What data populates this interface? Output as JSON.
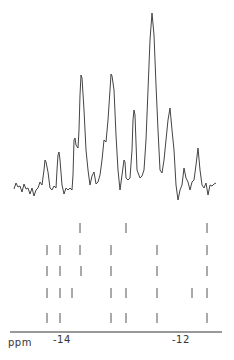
{
  "chart_data": {
    "type": "line",
    "title": "",
    "xlabel": "ppm",
    "ylabel": "",
    "x_axis": {
      "direction": "decreasing-left-to-right-magnitude",
      "ticks": [
        {
          "label": "-14",
          "px": 59
        },
        {
          "label": "-12",
          "px": 180
        }
      ],
      "range_ppm": [
        -14.2,
        -11.6
      ],
      "axis_line": {
        "x1": 10,
        "x2": 222,
        "y": 332
      }
    },
    "grid": false,
    "legend": null,
    "spectrum": {
      "description": "NMR spectrum trace with multiple resonances; tallest peak near -12.5 ppm",
      "points": [
        [
          14,
          189
        ],
        [
          16,
          183
        ],
        [
          18,
          187
        ],
        [
          20,
          186
        ],
        [
          22,
          192
        ],
        [
          24,
          184
        ],
        [
          26,
          189
        ],
        [
          28,
          188
        ],
        [
          30,
          194
        ],
        [
          32,
          188
        ],
        [
          34,
          196
        ],
        [
          36,
          190
        ],
        [
          38,
          188
        ],
        [
          40,
          182
        ],
        [
          42,
          185
        ],
        [
          44,
          170
        ],
        [
          45,
          160
        ],
        [
          46,
          162
        ],
        [
          48,
          172
        ],
        [
          50,
          188
        ],
        [
          52,
          190
        ],
        [
          54,
          186
        ],
        [
          56,
          188
        ],
        [
          57,
          170
        ],
        [
          58,
          155
        ],
        [
          59,
          152
        ],
        [
          60,
          160
        ],
        [
          62,
          185
        ],
        [
          64,
          194
        ],
        [
          66,
          188
        ],
        [
          68,
          190
        ],
        [
          70,
          188
        ],
        [
          72,
          190
        ],
        [
          73,
          175
        ],
        [
          74,
          140
        ],
        [
          75,
          138
        ],
        [
          76,
          145
        ],
        [
          78,
          148
        ],
        [
          79,
          130
        ],
        [
          80,
          95
        ],
        [
          81,
          75
        ],
        [
          82,
          78
        ],
        [
          84,
          110
        ],
        [
          86,
          150
        ],
        [
          88,
          170
        ],
        [
          90,
          185
        ],
        [
          92,
          176
        ],
        [
          94,
          172
        ],
        [
          96,
          184
        ],
        [
          98,
          182
        ],
        [
          100,
          175
        ],
        [
          102,
          160
        ],
        [
          104,
          140
        ],
        [
          106,
          142
        ],
        [
          108,
          120
        ],
        [
          110,
          90
        ],
        [
          111,
          74
        ],
        [
          112,
          76
        ],
        [
          114,
          90
        ],
        [
          116,
          135
        ],
        [
          118,
          170
        ],
        [
          120,
          190
        ],
        [
          122,
          175
        ],
        [
          124,
          160
        ],
        [
          125,
          162
        ],
        [
          126,
          178
        ],
        [
          128,
          180
        ],
        [
          130,
          178
        ],
        [
          132,
          150
        ],
        [
          133,
          120
        ],
        [
          134,
          110
        ],
        [
          135,
          115
        ],
        [
          137,
          170
        ],
        [
          140,
          178
        ],
        [
          142,
          176
        ],
        [
          144,
          170
        ],
        [
          146,
          140
        ],
        [
          148,
          90
        ],
        [
          150,
          40
        ],
        [
          152,
          13
        ],
        [
          154,
          35
        ],
        [
          156,
          85
        ],
        [
          158,
          130
        ],
        [
          160,
          170
        ],
        [
          162,
          173
        ],
        [
          164,
          160
        ],
        [
          166,
          140
        ],
        [
          168,
          120
        ],
        [
          170,
          108
        ],
        [
          172,
          130
        ],
        [
          174,
          150
        ],
        [
          176,
          185
        ],
        [
          178,
          200
        ],
        [
          180,
          190
        ],
        [
          182,
          185
        ],
        [
          184,
          168
        ],
        [
          186,
          178
        ],
        [
          188,
          182
        ],
        [
          190,
          190
        ],
        [
          192,
          182
        ],
        [
          194,
          180
        ],
        [
          196,
          165
        ],
        [
          198,
          148
        ],
        [
          200,
          170
        ],
        [
          202,
          185
        ],
        [
          204,
          188
        ],
        [
          206,
          183
        ],
        [
          208,
          195
        ],
        [
          210,
          185
        ],
        [
          212,
          186
        ],
        [
          214,
          184
        ],
        [
          216,
          183
        ]
      ]
    },
    "stick_rows": [
      {
        "row": 1,
        "y": 228,
        "x_px": [
          80,
          126,
          207
        ]
      },
      {
        "row": 2,
        "y": 250,
        "x_px": [
          47,
          60,
          80,
          111,
          157,
          207
        ]
      },
      {
        "row": 3,
        "y": 271,
        "x_px": [
          47,
          60,
          81,
          111,
          157,
          207
        ]
      },
      {
        "row": 4,
        "y": 293,
        "x_px": [
          47,
          60,
          72,
          111,
          126,
          157,
          192,
          207
        ]
      },
      {
        "row": 5,
        "y": 318,
        "x_px": [
          47,
          60,
          111,
          126,
          157,
          207
        ]
      }
    ]
  },
  "labels": {
    "unit": "ppm",
    "tick_minus14": "-14",
    "tick_minus12": "-12"
  },
  "colors": {
    "line": "#444444",
    "sticks": "#555555",
    "axis": "#333333",
    "background": "#ffffff"
  }
}
